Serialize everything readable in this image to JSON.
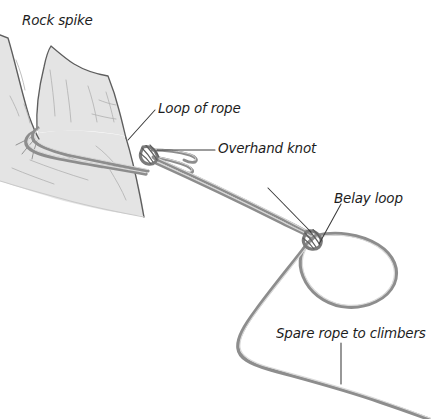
{
  "figure": {
    "background_color": "#ffffff",
    "width": 431,
    "height": 419
  },
  "labels": {
    "rock_spike": "Rock spike",
    "loop_of_rope": "Loop of rope",
    "overhand_knot": "Overhand knot",
    "belay_loop": "Belay loop",
    "spare_rope": "Spare rope to climbers"
  },
  "colors": {
    "rock_fill": "#e3e3e3",
    "rock_outline": "#5a5a5a",
    "rope_stroke": "#8b8b8b",
    "rope_highlight": "#d6d6d6",
    "leader_line": "#3a3a3a",
    "text": "#1d1d1d"
  },
  "illustration": {
    "rock_mass_description": "Shaded rock face occupying the upper-left quadrant with a pointed spike pillar",
    "rock_spike_description": "Tall pointed pillar of rock rising from the rock face",
    "rope_description": "Climbing rope looped around the base of the rock spike, tied with an overhand knot, running down-right to a second knot forming a belay loop, with spare rope continuing off the bottom-right of the frame",
    "leader_lines": [
      {
        "name": "loop-of-rope-leader",
        "from": [
          155,
          110
        ],
        "to": [
          128,
          140
        ]
      },
      {
        "name": "overhand-knot-leader",
        "from": [
          215,
          150
        ],
        "to": [
          157,
          150
        ]
      },
      {
        "name": "belay-loop-leader",
        "from": [
          340,
          203
        ],
        "to": [
          318,
          243
        ]
      },
      {
        "name": "spare-rope-leader",
        "from": [
          341,
          343
        ],
        "to": [
          341,
          383
        ]
      },
      {
        "name": "belay-knot-leader",
        "from": [
          268,
          188
        ],
        "to": [
          311,
          233
        ]
      }
    ]
  }
}
